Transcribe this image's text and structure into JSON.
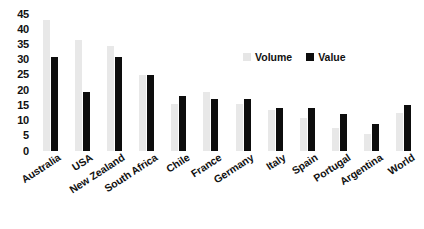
{
  "chart_data": {
    "type": "bar",
    "title": "",
    "subtitle": "",
    "xlabel": "",
    "ylabel": "",
    "ylim": [
      0,
      45
    ],
    "yticks": [
      0,
      5,
      10,
      15,
      20,
      25,
      30,
      35,
      40,
      45
    ],
    "grid": false,
    "legend_position": "top-right",
    "categories": [
      "Australia",
      "USA",
      "New Zealand",
      "South Africa",
      "Chile",
      "France",
      "Germany",
      "Italy",
      "Spain",
      "Portugal",
      "Argentina",
      "World"
    ],
    "series": [
      {
        "name": "Volume",
        "color": "#e8e8e8",
        "values": [
          43,
          36.5,
          34.5,
          25,
          15.5,
          19.5,
          15.5,
          13.5,
          11,
          7.5,
          5.5,
          12.5
        ]
      },
      {
        "name": "Value",
        "color": "#0d0d0d",
        "values": [
          31,
          19.5,
          31,
          25,
          18,
          17,
          17,
          14,
          14,
          12,
          9,
          15
        ]
      }
    ]
  },
  "legend": {
    "items": [
      {
        "label": "Volume",
        "swatch": "legend-swatch-volume"
      },
      {
        "label": "Value",
        "swatch": "legend-swatch-value"
      }
    ]
  }
}
